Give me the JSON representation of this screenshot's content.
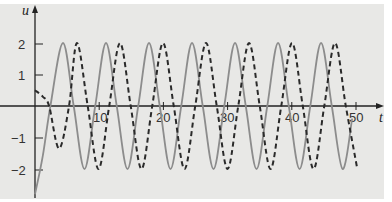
{
  "chart_data": {
    "type": "line",
    "title": "",
    "xlabel": "t",
    "ylabel": "u",
    "xlim": [
      0,
      52
    ],
    "ylim": [
      -2.9,
      2.4
    ],
    "grid": false,
    "legend": null,
    "x_ticks": [
      10,
      20,
      30,
      40,
      50
    ],
    "x_tick_labels": [
      "10",
      "20",
      "30",
      "40",
      "50"
    ],
    "y_ticks": [
      2,
      1,
      -1,
      -2
    ],
    "y_tick_labels": [
      "2",
      "1",
      "−1",
      "−2"
    ],
    "series": [
      {
        "name": "solid",
        "style": "solid",
        "color": "#8c8c8c",
        "points": [
          [
            0,
            -2.8
          ],
          [
            1.2,
            -1.6
          ],
          [
            2.4,
            0
          ],
          [
            4.36,
            2
          ],
          [
            6.03,
            0
          ],
          [
            7.71,
            -2
          ],
          [
            9.38,
            0
          ],
          [
            11.06,
            2
          ],
          [
            12.73,
            0
          ],
          [
            14.41,
            -2
          ],
          [
            16.08,
            0
          ],
          [
            17.76,
            2
          ],
          [
            19.43,
            0
          ],
          [
            21.11,
            -2
          ],
          [
            22.78,
            0
          ],
          [
            24.46,
            2
          ],
          [
            26.13,
            0
          ],
          [
            27.81,
            -2
          ],
          [
            29.48,
            0
          ],
          [
            31.16,
            2
          ],
          [
            32.83,
            0
          ],
          [
            34.51,
            -2
          ],
          [
            36.18,
            0
          ],
          [
            37.86,
            2
          ],
          [
            39.53,
            0
          ],
          [
            41.21,
            -2
          ],
          [
            42.88,
            0
          ],
          [
            44.56,
            2
          ],
          [
            46.23,
            0
          ],
          [
            47.91,
            -2
          ],
          [
            49.4,
            -0.4
          ]
        ]
      },
      {
        "name": "dashed",
        "style": "dashed",
        "color": "#2a2a2a",
        "points": [
          [
            0,
            0.5
          ],
          [
            1.2,
            0.3
          ],
          [
            2.2,
            0
          ],
          [
            3.74,
            -1.35
          ],
          [
            5.3,
            0
          ],
          [
            6.54,
            2
          ],
          [
            8.21,
            0
          ],
          [
            9.89,
            -2
          ],
          [
            11.56,
            0
          ],
          [
            13.24,
            2
          ],
          [
            14.91,
            0
          ],
          [
            16.59,
            -2
          ],
          [
            18.26,
            0
          ],
          [
            19.94,
            2
          ],
          [
            21.61,
            0
          ],
          [
            23.29,
            -2
          ],
          [
            24.96,
            0
          ],
          [
            26.64,
            2
          ],
          [
            28.31,
            0
          ],
          [
            29.99,
            -2
          ],
          [
            31.66,
            0
          ],
          [
            33.34,
            2
          ],
          [
            35.01,
            0
          ],
          [
            36.69,
            -2
          ],
          [
            38.36,
            0
          ],
          [
            40.04,
            2
          ],
          [
            41.71,
            0
          ],
          [
            43.39,
            -2
          ],
          [
            45.06,
            0
          ],
          [
            46.74,
            2
          ],
          [
            48.41,
            0
          ],
          [
            50.16,
            -1.95
          ]
        ]
      }
    ]
  },
  "labels": {
    "x_axis_var": "t",
    "y_axis_var": "u",
    "x10": "10",
    "x20": "20",
    "x30": "30",
    "x40": "40",
    "x50": "50",
    "y2": "2",
    "y1": "1",
    "ym1": "−1",
    "ym2": "−2"
  },
  "colors": {
    "panel": "#e8e8e6",
    "axis": "#222222"
  }
}
